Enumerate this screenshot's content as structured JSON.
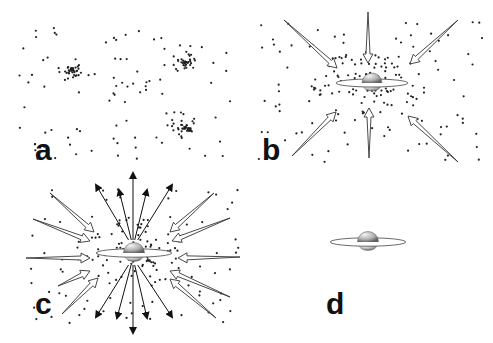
{
  "figure": {
    "panels": [
      {
        "id": "a",
        "label": "a",
        "description": "Dispersed particles with three dense clumps",
        "label_pos": [
          35,
          160
        ]
      },
      {
        "id": "b",
        "label": "b",
        "description": "Infall onto protostar with disk; arrows point inward",
        "label_pos": [
          262,
          160
        ]
      },
      {
        "id": "c",
        "label": "c",
        "description": "Infall plus bipolar outflow; arrows point inward and outward",
        "label_pos": [
          35,
          314
        ]
      },
      {
        "id": "d",
        "label": "d",
        "description": "Isolated star with disk",
        "label_pos": [
          326,
          314
        ]
      }
    ]
  },
  "colors": {
    "dot": "#222222",
    "arrow_stroke": "#333333",
    "arrow_fill": "#ffffff",
    "sphere_light": "#f2f2f2",
    "sphere_dark": "#6a6a6a",
    "label": "#111111"
  }
}
